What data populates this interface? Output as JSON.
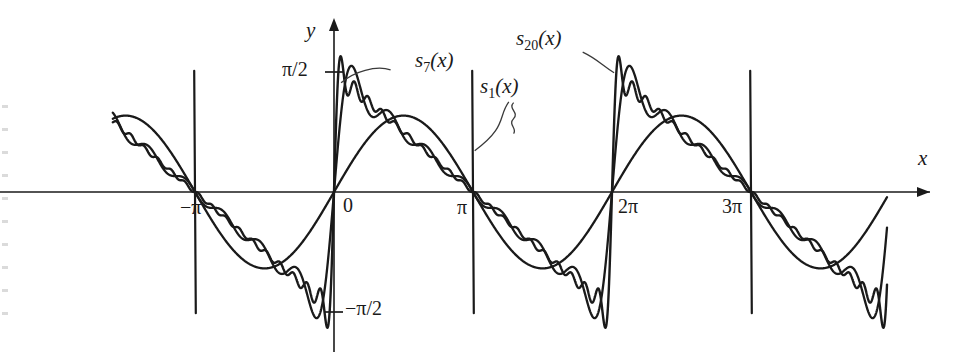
{
  "figure": {
    "background": "#ffffff",
    "ink": "#1a1a1a"
  },
  "axes": {
    "x_axis_label": "x",
    "y_axis_label": "y",
    "x_ticks": [
      {
        "label": "−π",
        "value": -3.14159
      },
      {
        "label": "0",
        "value": 0
      },
      {
        "label": "π",
        "value": 3.14159
      },
      {
        "label": "2π",
        "value": 6.28319
      },
      {
        "label": "3π",
        "value": 9.42478
      }
    ],
    "y_ticks": [
      {
        "label": "π/2",
        "value": 1.5708
      },
      {
        "label": "−π/2",
        "value": -1.5708
      }
    ]
  },
  "series_labels": [
    {
      "name": "s1",
      "label": "s",
      "sub": "1",
      "suffix": "(x)"
    },
    {
      "name": "s7",
      "label": "s",
      "sub": "7",
      "suffix": "(x)"
    },
    {
      "name": "s20",
      "label": "s",
      "sub": "20",
      "suffix": "(x)"
    }
  ],
  "chart_data": {
    "type": "line",
    "title": "",
    "xlabel": "x",
    "ylabel": "y",
    "xlim": [
      -5.0,
      12.5
    ],
    "ylim": [
      -2.05,
      2.05
    ],
    "grid": false,
    "legend": "inline-annotations",
    "function": "sawtooth f(x) = (pi - x mod 2pi)/2, partial Fourier sums s_n(x) = sum_{k=1..n} sin(kx)/k",
    "annotations": [
      {
        "text": "s_1(x)",
        "x": 4.05,
        "y": 1.32,
        "leader_to": [
          3.05,
          0.62
        ]
      },
      {
        "text": "s_7(x)",
        "x": 1.35,
        "y": 1.7,
        "leader_to": [
          0.3,
          1.5
        ]
      },
      {
        "text": "s_20(x)",
        "x": 5.3,
        "y": 1.93,
        "leader_to": [
          6.25,
          1.52
        ]
      }
    ],
    "series": [
      {
        "name": "s_1(x)",
        "harmonics": 1,
        "formula": "sin(x)"
      },
      {
        "name": "s_7(x)",
        "harmonics": 7,
        "formula": "sum_{k=1..7} sin(kx)/k"
      },
      {
        "name": "s_20(x)",
        "harmonics": 20,
        "formula": "sum_{k=1..20} sin(kx)/k"
      }
    ],
    "x_tick_values": [
      -3.14159,
      0,
      3.14159,
      6.28319,
      9.42478
    ],
    "x_tick_labels": [
      "−π",
      "0",
      "π",
      "2π",
      "3π"
    ],
    "y_tick_values": [
      1.5708,
      -1.5708
    ],
    "y_tick_labels": [
      "π/2",
      "−π/2"
    ]
  }
}
